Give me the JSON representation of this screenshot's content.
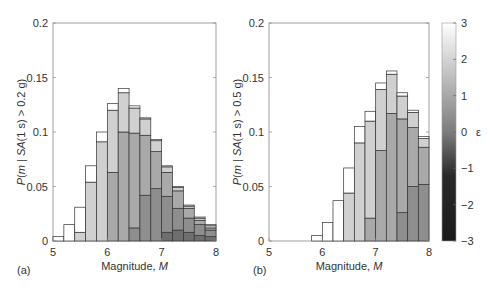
{
  "chart_data": [
    {
      "type": "bar",
      "stacked": true,
      "panel_label": "(a)",
      "xlabel": "Magnitude, M",
      "ylabel": "P(m | SA(1 s) > 0.2 g)",
      "xlim": [
        5,
        8
      ],
      "ylim": [
        0,
        0.2
      ],
      "xticks": [
        "5",
        "6",
        "7",
        "8"
      ],
      "yticks": [
        "0",
        "0.05",
        "0.1",
        "0.15",
        "0.2"
      ],
      "bin_width": 0.2,
      "categories": [
        5.0,
        5.2,
        5.4,
        5.6,
        5.8,
        6.0,
        6.2,
        6.4,
        6.6,
        6.8,
        7.0,
        7.2,
        7.4,
        7.6,
        7.8
      ],
      "series": [
        {
          "name": "epsilon -1 to 0",
          "color": "#6e6e6e",
          "values": [
            0,
            0,
            0,
            0,
            0,
            0,
            0,
            0,
            0,
            0,
            0.008,
            0.01,
            0.008,
            0.005,
            0.004
          ]
        },
        {
          "name": "epsilon 0 to 1",
          "color": "#8e8e8e",
          "values": [
            0,
            0,
            0,
            0,
            0,
            0,
            0,
            0.012,
            0.042,
            0.048,
            0.033,
            0.02,
            0.013,
            0.01,
            0.006
          ]
        },
        {
          "name": "epsilon 1 to 2",
          "color": "#a9a9a9",
          "values": [
            0,
            0,
            0,
            0,
            0,
            0.063,
            0.1,
            0.087,
            0.055,
            0.034,
            0.022,
            0.016,
            0.009,
            0.004,
            0.002
          ]
        },
        {
          "name": "epsilon 2 to 3",
          "color": "#d0d0d0",
          "values": [
            0,
            0,
            0.008,
            0.054,
            0.091,
            0.057,
            0.036,
            0.023,
            0.015,
            0.01,
            0.005,
            0.003,
            0.002,
            0.002,
            0.002
          ]
        },
        {
          "name": "epsilon > 3",
          "color": "#ffffff",
          "values": [
            0.004,
            0.015,
            0.023,
            0.015,
            0.009,
            0.006,
            0.004,
            0.002,
            0.001,
            0.001,
            0.001,
            0.001,
            0.001,
            0.001,
            0.001
          ]
        }
      ],
      "totals": [
        0.004,
        0.015,
        0.031,
        0.069,
        0.1,
        0.126,
        0.14,
        0.124,
        0.113,
        0.093,
        0.069,
        0.05,
        0.033,
        0.022,
        0.015
      ]
    },
    {
      "type": "bar",
      "stacked": true,
      "panel_label": "(b)",
      "xlabel": "Magnitude, M",
      "ylabel": "P(m | SA(1 s) > 0.5 g)",
      "xlim": [
        5,
        8
      ],
      "ylim": [
        0,
        0.2
      ],
      "xticks": [
        "5",
        "6",
        "7",
        "8"
      ],
      "yticks": [
        "0",
        "0.05",
        "0.1",
        "0.15",
        "0.2"
      ],
      "bin_width": 0.2,
      "categories": [
        5.0,
        5.2,
        5.4,
        5.6,
        5.8,
        6.0,
        6.2,
        6.4,
        6.6,
        6.8,
        7.0,
        7.2,
        7.4,
        7.6,
        7.8
      ],
      "series": [
        {
          "name": "epsilon 0 to 1",
          "color": "#8e8e8e",
          "values": [
            0,
            0,
            0,
            0,
            0,
            0,
            0,
            0,
            0,
            0,
            0,
            0,
            0.026,
            0.05,
            0.052
          ]
        },
        {
          "name": "epsilon 1 to 2",
          "color": "#a9a9a9",
          "values": [
            0,
            0,
            0,
            0,
            0,
            0,
            0,
            0,
            0,
            0.021,
            0.083,
            0.117,
            0.086,
            0.054,
            0.034
          ]
        },
        {
          "name": "epsilon 2 to 3",
          "color": "#d0d0d0",
          "values": [
            0,
            0,
            0,
            0,
            0,
            0,
            0,
            0.044,
            0.09,
            0.089,
            0.056,
            0.036,
            0.021,
            0.014,
            0.008
          ]
        },
        {
          "name": "epsilon > 3",
          "color": "#ffffff",
          "values": [
            0,
            0,
            0,
            0,
            0.005,
            0.017,
            0.037,
            0.023,
            0.015,
            0.009,
            0.006,
            0.003,
            0.003,
            0.002,
            0.002
          ]
        }
      ],
      "totals": [
        0,
        0,
        0,
        0,
        0.005,
        0.017,
        0.037,
        0.067,
        0.105,
        0.119,
        0.145,
        0.156,
        0.136,
        0.12,
        0.096
      ]
    }
  ],
  "colorbar": {
    "label": "ε",
    "ticks": [
      "3",
      "2",
      "1",
      "0",
      "−1",
      "−2",
      "−3"
    ],
    "range": [
      -3,
      3
    ]
  },
  "labels": {
    "panel_a": "(a)",
    "panel_b": "(b)",
    "xlabel_a": "Magnitude, ",
    "xlabel_b": "Magnitude, ",
    "xlabel_var": "M",
    "ylabel_a": "P(m | SA(1 s) > 0.2 g)",
    "ylabel_b": "P(m | SA(1 s) > 0.5 g)"
  }
}
